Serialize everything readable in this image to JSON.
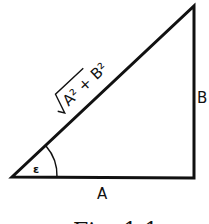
{
  "figure": {
    "caption": "Fig. 1.1",
    "labels": {
      "base": "A",
      "height": "B",
      "angle": "ε",
      "hypotenuse_radicand": "A² + B²"
    },
    "colors": {
      "stroke": "#111111",
      "background": "#ffffff"
    }
  }
}
